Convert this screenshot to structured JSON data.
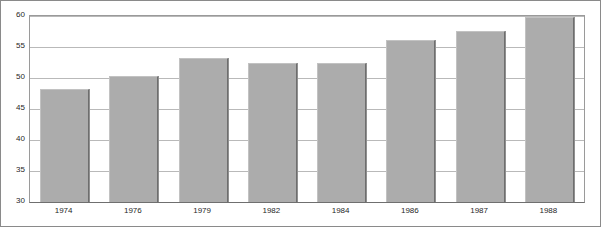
{
  "figure": {
    "top_clipped_note": "",
    "background_color": "#ffffff",
    "border_color": "#8a8a8a"
  },
  "chart_data": {
    "type": "bar",
    "title": "",
    "subtitle": "",
    "xlabel": "",
    "ylabel": "",
    "categories": [
      "1974",
      "1976",
      "1979",
      "1982",
      "1984",
      "1986",
      "1987",
      "1988"
    ],
    "values": [
      48.3,
      50.4,
      53.3,
      52.4,
      52.4,
      56.1,
      57.5,
      59.8
    ],
    "ylim": [
      30,
      60
    ],
    "yticks": [
      30,
      35,
      40,
      45,
      50,
      55,
      60
    ],
    "ytick_labels": [
      "30",
      "35",
      "40",
      "45",
      "50",
      "55",
      "60"
    ],
    "grid": "horizontal",
    "legend": "none",
    "bar_color": "#acacac",
    "bar_edge_color": "#6e6e6e",
    "grid_color": "#b9b9b9",
    "axis_color": "#6f6f6f"
  }
}
